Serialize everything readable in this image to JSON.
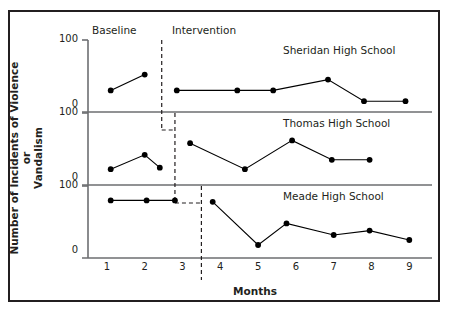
{
  "figure": {
    "xlabel": "Months",
    "ylabel_line1": "Number of Incidents of Violence or",
    "ylabel_line2": "Vandalism",
    "phase_baseline": "Baseline",
    "phase_intervention": "Intervention",
    "xticks": [
      "1",
      "2",
      "3",
      "4",
      "5",
      "6",
      "7",
      "8",
      "9"
    ],
    "panel_ticks": [
      "100",
      "0"
    ],
    "colors": {
      "ink": "#231f20",
      "axis": "#6d6e71",
      "marker": "#000000"
    }
  },
  "chart_data": {
    "type": "line",
    "title": "",
    "subtitle": "",
    "xlabel": "Months",
    "ylabel": "Number of Incidents of Violence or Vandalism",
    "xlim": [
      0.5,
      9.6
    ],
    "ylim": [
      0,
      100
    ],
    "yticks": [
      0,
      100
    ],
    "grid": false,
    "legend": "none",
    "layout": "multiple-baseline stacked panels (3 rows, shared x-axis)",
    "annotations": [
      {
        "text": "Baseline",
        "x": 1.55,
        "panel": 0,
        "role": "phase-header"
      },
      {
        "text": "Intervention",
        "x": 3.6,
        "panel": 0,
        "role": "phase-header"
      }
    ],
    "panels": [
      {
        "name": "Sheridan High School",
        "label": "Sheridan High School",
        "phase_change_x": 2.45,
        "series": [
          {
            "name": "Baseline",
            "x": [
              1.1,
              2.0
            ],
            "values": [
              30,
              52
            ]
          },
          {
            "name": "Intervention",
            "x": [
              2.85,
              4.45,
              5.4,
              6.85,
              7.8,
              8.9
            ],
            "values": [
              30,
              30,
              30,
              45,
              15,
              15
            ]
          }
        ]
      },
      {
        "name": "Thomas High School",
        "label": "Thomas High School",
        "phase_change_x": 2.8,
        "series": [
          {
            "name": "Baseline",
            "x": [
              1.1,
              2.0,
              2.4
            ],
            "values": [
              22,
              42,
              24
            ]
          },
          {
            "name": "Intervention",
            "x": [
              3.2,
              4.65,
              5.9,
              6.95,
              7.95
            ],
            "values": [
              58,
              22,
              62,
              35,
              35
            ]
          }
        ]
      },
      {
        "name": "Meade High School",
        "label": "Meade High School",
        "phase_change_x": 3.5,
        "series": [
          {
            "name": "Baseline",
            "x": [
              1.1,
              2.05,
              2.8
            ],
            "values": [
              80,
              80,
              80
            ]
          },
          {
            "name": "Intervention",
            "x": [
              3.8,
              5.0,
              5.75,
              7.0,
              7.95,
              9.0
            ],
            "values": [
              78,
              18,
              48,
              32,
              38,
              25
            ]
          }
        ]
      }
    ]
  }
}
